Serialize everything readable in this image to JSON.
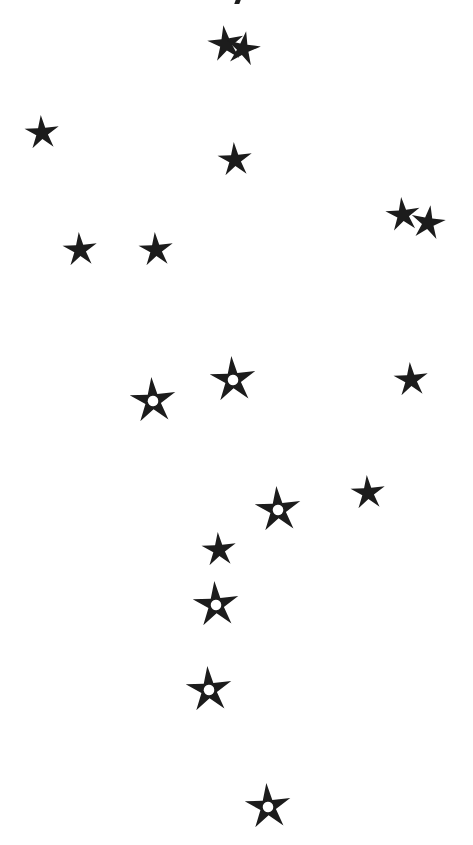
{
  "canvas": {
    "width": 473,
    "height": 845,
    "background": "#ffffff"
  },
  "star_color": "#1c1c1c",
  "hole_color": "#ffffff",
  "top_mark": {
    "x": 235,
    "y": 0,
    "w": 5,
    "h": 4
  },
  "stars": [
    {
      "x": 226,
      "y": 44,
      "size": 38,
      "rot": -8,
      "hole": false
    },
    {
      "x": 243,
      "y": 49,
      "size": 36,
      "rot": 10,
      "hole": false
    },
    {
      "x": 42,
      "y": 133,
      "size": 36,
      "rot": -4,
      "hole": false
    },
    {
      "x": 235,
      "y": 160,
      "size": 36,
      "rot": -4,
      "hole": false
    },
    {
      "x": 80,
      "y": 250,
      "size": 36,
      "rot": -4,
      "hole": false
    },
    {
      "x": 156,
      "y": 250,
      "size": 36,
      "rot": -4,
      "hole": false
    },
    {
      "x": 403,
      "y": 215,
      "size": 36,
      "rot": -6,
      "hole": false
    },
    {
      "x": 428,
      "y": 223,
      "size": 36,
      "rot": 8,
      "hole": false
    },
    {
      "x": 153,
      "y": 401,
      "size": 48,
      "rot": -4,
      "hole": true
    },
    {
      "x": 233,
      "y": 380,
      "size": 48,
      "rot": -4,
      "hole": true
    },
    {
      "x": 411,
      "y": 380,
      "size": 36,
      "rot": -4,
      "hole": false
    },
    {
      "x": 278,
      "y": 510,
      "size": 48,
      "rot": -4,
      "hole": true
    },
    {
      "x": 368,
      "y": 493,
      "size": 36,
      "rot": -4,
      "hole": false
    },
    {
      "x": 219,
      "y": 550,
      "size": 36,
      "rot": -4,
      "hole": false
    },
    {
      "x": 216,
      "y": 605,
      "size": 48,
      "rot": -4,
      "hole": true
    },
    {
      "x": 209,
      "y": 690,
      "size": 48,
      "rot": -4,
      "hole": true
    },
    {
      "x": 268,
      "y": 807,
      "size": 48,
      "rot": -4,
      "hole": true
    }
  ]
}
